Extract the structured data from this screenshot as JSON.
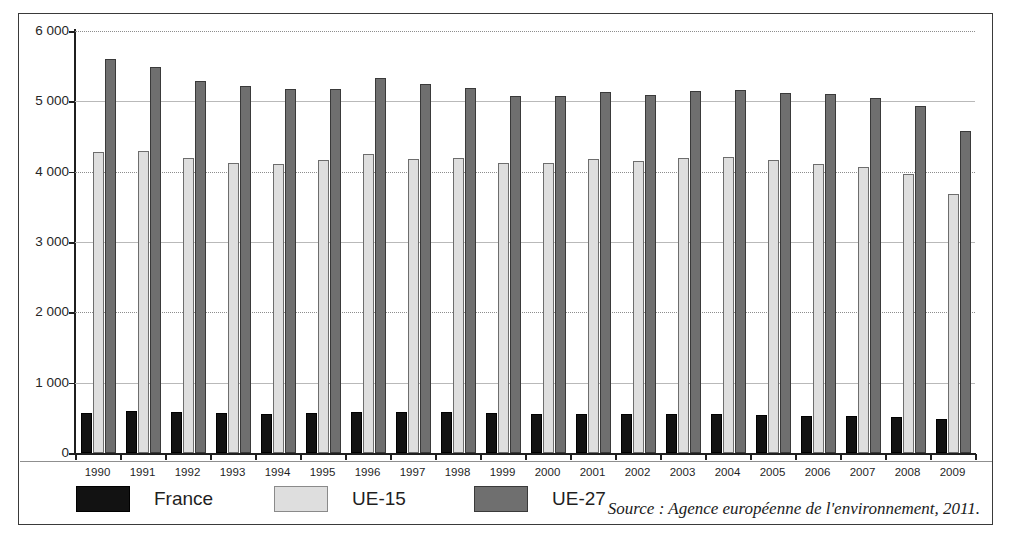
{
  "figure": {
    "title_cropped": "",
    "source_note": "Source : Agence européenne de l'environnement, 2011."
  },
  "legend": {
    "position": "bottom-left",
    "items": [
      {
        "label": "France",
        "color": "#121212",
        "key": "france"
      },
      {
        "label": "UE-15",
        "color": "#dedede",
        "key": "ue15"
      },
      {
        "label": "UE-27",
        "color": "#6f6f6f",
        "key": "ue27"
      }
    ]
  },
  "axes": {
    "y_ticks": [
      "0",
      "1 000",
      "2 000",
      "3 000",
      "4 000",
      "5 000",
      "6 000"
    ],
    "y_min": 0,
    "y_max": 6000,
    "y_step": 1000
  },
  "chart_data": {
    "type": "bar",
    "title": "",
    "subtitle": "",
    "xlabel": "",
    "ylabel": "",
    "ylim": [
      0,
      6000
    ],
    "ytick_values": [
      0,
      1000,
      2000,
      3000,
      4000,
      5000,
      6000
    ],
    "ytick_labels": [
      "0",
      "1 000",
      "2 000",
      "3 000",
      "4 000",
      "5 000",
      "6 000"
    ],
    "grid": true,
    "legend_position": "bottom-left",
    "grouping": "grouped",
    "categories": [
      "1990",
      "1991",
      "1992",
      "1993",
      "1994",
      "1995",
      "1996",
      "1997",
      "1998",
      "1999",
      "2000",
      "2001",
      "2002",
      "2003",
      "2004",
      "2005",
      "2006",
      "2007",
      "2008",
      "2009"
    ],
    "series": [
      {
        "name": "France",
        "color": "#121212",
        "values": [
          568,
          600,
          588,
          565,
          552,
          565,
          578,
          585,
          588,
          570,
          560,
          560,
          550,
          548,
          548,
          545,
          528,
          520,
          512,
          490
        ]
      },
      {
        "name": "UE-15",
        "color": "#dedede",
        "values": [
          4280,
          4295,
          4195,
          4125,
          4115,
          4160,
          4245,
          4175,
          4195,
          4125,
          4130,
          4180,
          4150,
          4190,
          4205,
          4165,
          4115,
          4060,
          3965,
          3680
        ]
      },
      {
        "name": "UE-27",
        "color": "#6f6f6f",
        "values": [
          5605,
          5495,
          5295,
          5215,
          5175,
          5180,
          5330,
          5240,
          5190,
          5075,
          5075,
          5130,
          5090,
          5150,
          5160,
          5125,
          5105,
          5045,
          4940,
          4580
        ]
      }
    ],
    "source": "Source : Agence européenne de l'environnement, 2011."
  }
}
